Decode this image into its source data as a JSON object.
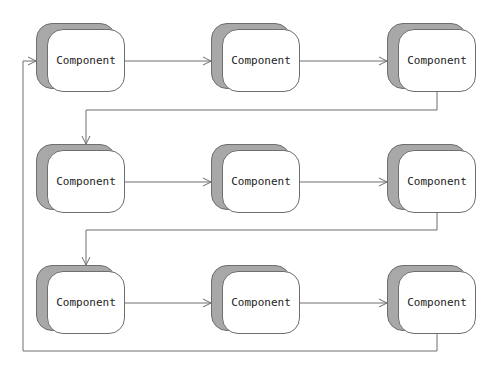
{
  "diagram": {
    "type": "flow-grid",
    "colors": {
      "line": "#6e6e6e",
      "shadow": "#a8a8a8",
      "box": "#ffffff",
      "text": "#222222"
    },
    "nodes": [
      {
        "id": "n1",
        "label": "Component",
        "row": 0,
        "col": 0
      },
      {
        "id": "n2",
        "label": "Component",
        "row": 0,
        "col": 1
      },
      {
        "id": "n3",
        "label": "Component",
        "row": 0,
        "col": 2
      },
      {
        "id": "n4",
        "label": "Component",
        "row": 1,
        "col": 0
      },
      {
        "id": "n5",
        "label": "Component",
        "row": 1,
        "col": 1
      },
      {
        "id": "n6",
        "label": "Component",
        "row": 1,
        "col": 2
      },
      {
        "id": "n7",
        "label": "Component",
        "row": 2,
        "col": 0
      },
      {
        "id": "n8",
        "label": "Component",
        "row": 2,
        "col": 1
      },
      {
        "id": "n9",
        "label": "Component",
        "row": 2,
        "col": 2
      }
    ],
    "edges": [
      {
        "from": "n1",
        "to": "n2"
      },
      {
        "from": "n2",
        "to": "n3"
      },
      {
        "from": "n3",
        "to": "n4"
      },
      {
        "from": "n4",
        "to": "n5"
      },
      {
        "from": "n5",
        "to": "n6"
      },
      {
        "from": "n6",
        "to": "n7"
      },
      {
        "from": "n7",
        "to": "n8"
      },
      {
        "from": "n8",
        "to": "n9"
      },
      {
        "from": "n9",
        "to": "n1"
      }
    ]
  }
}
